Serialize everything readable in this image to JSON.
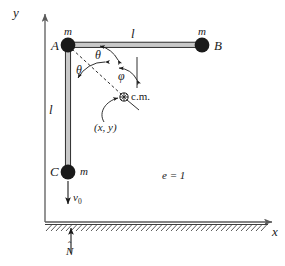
{
  "figure": {
    "type": "physics-mechanics-diagram",
    "axes": {
      "y_label": "y",
      "x_label": "x",
      "origin_x": 45,
      "origin_y": 222
    },
    "masses": [
      {
        "id": "A",
        "vertex_label": "A",
        "mass_label": "m",
        "x": 68,
        "y": 45
      },
      {
        "id": "B",
        "vertex_label": "B",
        "mass_label": "m",
        "x": 202,
        "y": 45
      },
      {
        "id": "C",
        "vertex_label": "C",
        "mass_label": "m",
        "x": 68,
        "y": 172
      }
    ],
    "rods": [
      {
        "from": "A",
        "to": "B",
        "length_label": "l",
        "orientation": "horizontal"
      },
      {
        "from": "A",
        "to": "C",
        "length_label": "l",
        "orientation": "vertical"
      }
    ],
    "center_of_mass": {
      "marker": "circle-plus-icon",
      "label": "c.m.",
      "coordinate_label": "(x, y)",
      "x": 124,
      "y": 97
    },
    "angles": [
      {
        "name": "theta_upper",
        "label": "θ",
        "between": "rod AB and line A to c.m."
      },
      {
        "name": "theta_lower",
        "label": "θ",
        "between": "line A to c.m. and rod AC"
      },
      {
        "name": "phi",
        "label": "φ",
        "between": "vertical reference and line to c.m."
      }
    ],
    "velocity": {
      "label": "v",
      "subscript": "0",
      "direction": "down",
      "at_mass": "C"
    },
    "normal": {
      "label": "N",
      "accent": "ˆ",
      "direction": "up"
    },
    "restitution": {
      "label": "e = 1"
    },
    "ground": {
      "style": "hatched",
      "y": 222
    },
    "colors": {
      "ink": "#1a1a1a",
      "rod_fill": "#c8c8c8",
      "mass_fill": "#1a1a1a",
      "axis": "#5a5a5a",
      "faint": "#b4b4b4"
    }
  }
}
